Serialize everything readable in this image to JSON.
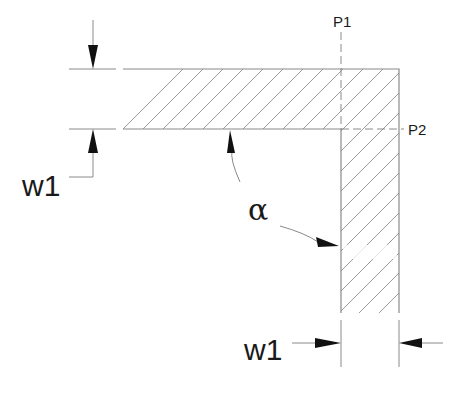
{
  "diagram": {
    "labels": {
      "w1_left": "w1",
      "w1_bottom": "w1",
      "alpha": "α",
      "p1": "P1",
      "p2": "P2"
    },
    "colors": {
      "line": "#8a8a8a",
      "hatch": "#9a9a9a",
      "arrow": "#111111",
      "text": "#1a1a1a",
      "background": "#ffffff"
    }
  }
}
